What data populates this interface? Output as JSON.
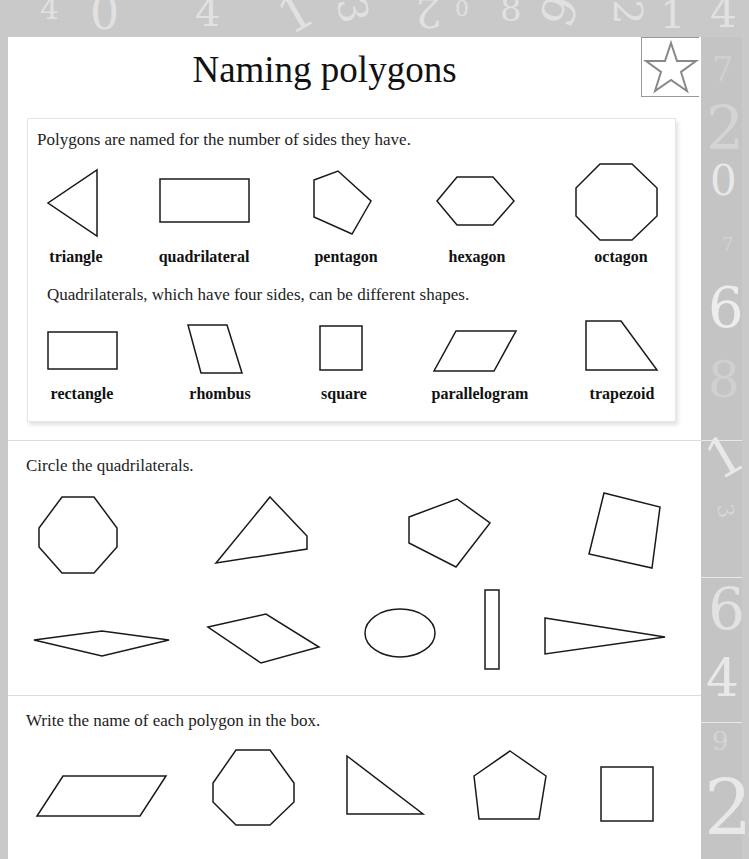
{
  "header": {
    "title": "Naming polygons",
    "badge_icon": "star-icon"
  },
  "background": {
    "top_digits": [
      "4",
      "0",
      "4",
      "1",
      "3",
      "2",
      "0",
      "8",
      "9",
      "2",
      "1",
      "4"
    ],
    "side_digits": [
      "7",
      "2",
      "0",
      "7",
      "6",
      "8",
      "1",
      "3",
      "9",
      "4",
      "9",
      "2"
    ]
  },
  "intro": {
    "text": "Polygons are named for the number of sides they have.",
    "shapes": [
      {
        "name": "triangle",
        "label": "triangle"
      },
      {
        "name": "quadrilateral",
        "label": "quadrilateral"
      },
      {
        "name": "pentagon",
        "label": "pentagon"
      },
      {
        "name": "hexagon",
        "label": "hexagon"
      },
      {
        "name": "octagon",
        "label": "octagon"
      }
    ],
    "quad_text": "Quadrilaterals, which have four sides, can be different shapes.",
    "quad_shapes": [
      {
        "name": "rectangle",
        "label": "rectangle"
      },
      {
        "name": "rhombus",
        "label": "rhombus"
      },
      {
        "name": "square",
        "label": "square"
      },
      {
        "name": "parallelogram",
        "label": "parallelogram"
      },
      {
        "name": "trapezoid",
        "label": "trapezoid"
      }
    ]
  },
  "exercise1": {
    "instruction": "Circle the quadrilaterals.",
    "shapes": [
      "octagon",
      "quadrilateral",
      "pentagon",
      "quadrilateral",
      "rhombus",
      "quadrilateral",
      "circle",
      "rectangle",
      "triangle"
    ]
  },
  "exercise2": {
    "instruction": "Write the name of each polygon in the box.",
    "shapes": [
      "parallelogram",
      "octagon",
      "triangle",
      "pentagon",
      "rectangle"
    ]
  }
}
